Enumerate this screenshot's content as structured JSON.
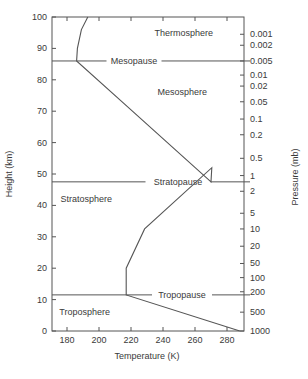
{
  "chart_data": {
    "type": "line",
    "title": "",
    "xlabel": "Temperature (K)",
    "ylabel": "Height (km)",
    "y2label": "Pressure (mb)",
    "xlim": [
      170,
      290
    ],
    "ylim": [
      0,
      100
    ],
    "x_ticks": [
      180,
      200,
      220,
      240,
      260,
      280
    ],
    "y_ticks": [
      0,
      10,
      20,
      30,
      40,
      50,
      60,
      70,
      80,
      90,
      100
    ],
    "y2_ticks": [
      {
        "label": "0.001",
        "height": 94.5
      },
      {
        "label": "0.002",
        "height": 91
      },
      {
        "label": "0.005",
        "height": 86
      },
      {
        "label": "0.01",
        "height": 81.5
      },
      {
        "label": "0.02",
        "height": 78
      },
      {
        "label": "0.05",
        "height": 73
      },
      {
        "label": "0.1",
        "height": 67.5
      },
      {
        "label": "0.2",
        "height": 62.5
      },
      {
        "label": "0.5",
        "height": 55
      },
      {
        "label": "1",
        "height": 49.5
      },
      {
        "label": "2",
        "height": 44.5
      },
      {
        "label": "5",
        "height": 37.5
      },
      {
        "label": "10",
        "height": 32.5
      },
      {
        "label": "20",
        "height": 27
      },
      {
        "label": "50",
        "height": 21.5
      },
      {
        "label": "100",
        "height": 17
      },
      {
        "label": "200",
        "height": 12.5
      },
      {
        "label": "500",
        "height": 6
      },
      {
        "label": "1000",
        "height": 0
      }
    ],
    "grid": false,
    "legend": null,
    "series": [
      {
        "name": "Temperature profile",
        "x": [
          288,
          217,
          217,
          228.5,
          270.5,
          270,
          215.5,
          186,
          186.5,
          189,
          193
        ],
        "y": [
          0,
          11.5,
          20,
          32.5,
          52,
          47.5,
          72.5,
          86,
          90,
          96,
          100
        ]
      }
    ],
    "layer_boundaries": [
      {
        "name": "Tropopause",
        "height": 11.5
      },
      {
        "name": "Stratopause",
        "height": 47.5
      },
      {
        "name": "Mesopause",
        "height": 86
      }
    ],
    "region_labels": [
      {
        "name": "Troposphere",
        "temperature": 191,
        "height": 6
      },
      {
        "name": "Stratosphere",
        "temperature": 192,
        "height": 42
      },
      {
        "name": "Mesosphere",
        "temperature": 252,
        "height": 76
      },
      {
        "name": "Thermosphere",
        "temperature": 253,
        "height": 95
      }
    ]
  },
  "labels": {
    "xlabel": "Temperature (K)",
    "ylabel": "Height (km)",
    "y2label": "Pressure (mb)"
  },
  "colors": {
    "axis": "#555555",
    "curve": "#555555",
    "text": "#3a3a3a"
  }
}
